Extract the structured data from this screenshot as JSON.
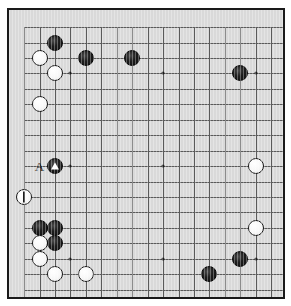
{
  "diagram": {
    "type": "go-board-diagram",
    "board_size": 19,
    "background_color": "#d9d9d9",
    "line_color": "#5a5a5a",
    "border_color": "#1a1a1a",
    "black_color": "#1a1a1a",
    "white_color": "#ffffff"
  },
  "geometry": {
    "origin_x": 22,
    "origin_y": 25,
    "spacing": 15.45,
    "stone_diameter": 16,
    "board_left": 7,
    "board_top": 8,
    "board_width": 278,
    "board_height": 291
  },
  "hoshi": [
    {
      "col": 3,
      "row": 3
    },
    {
      "col": 9,
      "row": 3
    },
    {
      "col": 15,
      "row": 3
    },
    {
      "col": 3,
      "row": 9
    },
    {
      "col": 9,
      "row": 9
    },
    {
      "col": 15,
      "row": 9
    },
    {
      "col": 3,
      "row": 15
    },
    {
      "col": 9,
      "row": 15
    },
    {
      "col": 15,
      "row": 15
    }
  ],
  "stones": [
    {
      "id": "b-top-left-1",
      "color": "black",
      "col": 2,
      "row": 1,
      "mark": "none"
    },
    {
      "id": "w-top-left-1",
      "color": "white",
      "col": 1,
      "row": 2,
      "mark": "none"
    },
    {
      "id": "w-top-left-2",
      "color": "white",
      "col": 2,
      "row": 3,
      "mark": "none"
    },
    {
      "id": "b-top-1",
      "color": "black",
      "col": 4,
      "row": 2,
      "mark": "none"
    },
    {
      "id": "b-top-2",
      "color": "black",
      "col": 7,
      "row": 2,
      "mark": "none"
    },
    {
      "id": "w-left-1",
      "color": "white",
      "col": 1,
      "row": 5,
      "mark": "none"
    },
    {
      "id": "b-top-right-1",
      "color": "black",
      "col": 14,
      "row": 3,
      "mark": "none"
    },
    {
      "id": "b-marked-triangle",
      "color": "black",
      "col": 2,
      "row": 9,
      "mark": "triangle"
    },
    {
      "id": "w-right-center",
      "color": "white",
      "col": 15,
      "row": 9,
      "mark": "none"
    },
    {
      "id": "w-marked-bar",
      "color": "white",
      "col": 0,
      "row": 11,
      "mark": "bar"
    },
    {
      "id": "b-lower-left-1",
      "color": "black",
      "col": 1,
      "row": 13,
      "mark": "none"
    },
    {
      "id": "b-lower-left-2",
      "color": "black",
      "col": 2,
      "row": 13,
      "mark": "none"
    },
    {
      "id": "w-lower-left-1",
      "color": "white",
      "col": 1,
      "row": 14,
      "mark": "none"
    },
    {
      "id": "b-lower-left-3",
      "color": "black",
      "col": 2,
      "row": 14,
      "mark": "none"
    },
    {
      "id": "w-lower-left-2",
      "color": "white",
      "col": 1,
      "row": 15,
      "mark": "none"
    },
    {
      "id": "w-right-lower",
      "color": "white",
      "col": 15,
      "row": 13,
      "mark": "none"
    },
    {
      "id": "w-bottom-1",
      "color": "white",
      "col": 2,
      "row": 16,
      "mark": "none"
    },
    {
      "id": "w-bottom-2",
      "color": "white",
      "col": 4,
      "row": 16,
      "mark": "none"
    },
    {
      "id": "b-bottom-right-1",
      "color": "black",
      "col": 14,
      "row": 15,
      "mark": "none"
    },
    {
      "id": "b-bottom-right-2",
      "color": "black",
      "col": 12,
      "row": 16,
      "mark": "none"
    }
  ],
  "labels": [
    {
      "id": "label-a",
      "text": "A",
      "col": 1,
      "row": 9
    }
  ]
}
